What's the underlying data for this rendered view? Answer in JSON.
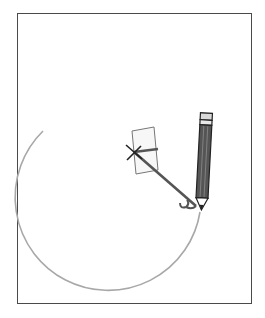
{
  "figure": {
    "colors": {
      "frame": "#4a4a4a",
      "arc": "#a8a8a8",
      "arm": "#555555",
      "pivot_mark": "#222222",
      "paper_fill": "#f7f7f7",
      "paper_stroke": "#777777",
      "pencil_body": "#555555",
      "pencil_outline": "#222222",
      "eraser": "#d8d8d8"
    },
    "pivot": {
      "x": 134,
      "y": 152
    },
    "arc_radius": 93,
    "pencil_tip": {
      "x": 200,
      "y": 210
    }
  }
}
